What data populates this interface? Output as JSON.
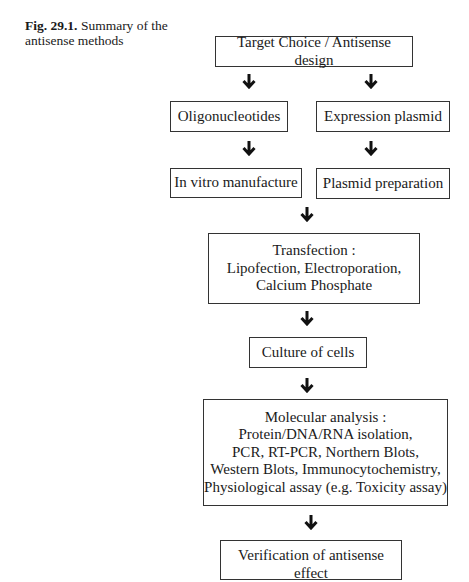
{
  "caption": {
    "label": "Fig. 29.1.",
    "text": "Summary of the antisense methods"
  },
  "flowchart": {
    "target": "Target Choice / Antisense design",
    "left_branch": {
      "step1": "Oligonucleotides",
      "step2": "In vitro manufacture"
    },
    "right_branch": {
      "step1": "Expression plasmid",
      "step2": "Plasmid preparation"
    },
    "transfection": {
      "title": "Transfection :",
      "line1": "Lipofection, Electroporation,",
      "line2": "Calcium Phosphate"
    },
    "culture": "Culture of cells",
    "analysis": {
      "title": "Molecular analysis :",
      "line1": "Protein/DNA/RNA isolation,",
      "line2": "PCR, RT-PCR, Northern Blots,",
      "line3": "Western Blots, Immunocytochemistry,",
      "line4": "Physiological assay (e.g. Toxicity assay)"
    },
    "verification": "Verification of antisense effect"
  },
  "colors": {
    "stroke": "#333333",
    "text": "#1a1a1a",
    "background": "#ffffff"
  }
}
